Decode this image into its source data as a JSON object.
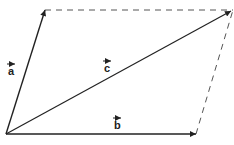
{
  "diagram": {
    "vectors": [
      {
        "name": "a",
        "label": "a",
        "from": [
          6,
          134
        ],
        "to": [
          45,
          10
        ]
      },
      {
        "name": "b",
        "label": "b",
        "from": [
          6,
          134
        ],
        "to": [
          196,
          134
        ]
      },
      {
        "name": "c",
        "label": "c",
        "from": [
          6,
          134
        ],
        "to": [
          233,
          10
        ]
      }
    ],
    "dashed_edges": [
      {
        "from": [
          45,
          10
        ],
        "to": [
          233,
          10
        ]
      },
      {
        "from": [
          196,
          134
        ],
        "to": [
          233,
          10
        ]
      }
    ],
    "labels": {
      "a": "a",
      "b": "b",
      "c": "c"
    },
    "colors": {
      "stroke": "#222222",
      "dashed": "#555555"
    }
  }
}
